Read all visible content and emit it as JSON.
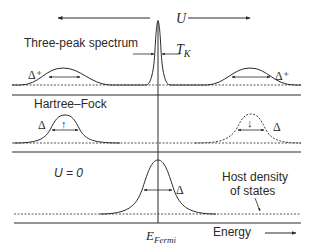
{
  "figure": {
    "top_axis": {
      "label": "U"
    },
    "panels": [
      {
        "id": "three-peak",
        "title": "Three-peak spectrum",
        "left_peak_label": "Δ⁺",
        "right_peak_label": "Δ⁺",
        "kondo_width_label_main": "T",
        "kondo_width_label_sub": "K"
      },
      {
        "id": "hartree-fock",
        "title": "Hartree–Fock",
        "left_peak_label": "Δ",
        "right_peak_label": "Δ",
        "left_spin": "↑",
        "right_spin": "↓"
      },
      {
        "id": "u-zero",
        "title": "U = 0",
        "peak_label": "Δ",
        "host_dos_label_line1": "Host density",
        "host_dos_label_line2": "of states"
      }
    ],
    "x_axis": {
      "fermi_label_main": "E",
      "fermi_label_sub": "Fermi",
      "energy_label": "Energy"
    },
    "colors": {
      "ink": "#2a2a2a",
      "background": "#ffffff"
    }
  }
}
